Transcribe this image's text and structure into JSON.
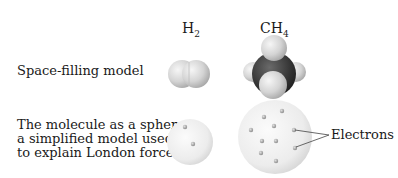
{
  "columns": [
    {
      "formula": "H",
      "subscript": "2"
    },
    {
      "formula": "CH",
      "subscript": "4"
    }
  ],
  "rows": [
    {
      "label": "Space-filling model"
    },
    {
      "label_lines": [
        "The molecule as a sphere,",
        "a simplified model used",
        "to explain London forces"
      ]
    }
  ],
  "annotation": {
    "label": "Electrons"
  },
  "colors": {
    "hydrogen": "#d8d8d8",
    "carbon": "#3a3a3a",
    "sphere": "#eeeeee",
    "electron": "#a8a8a8"
  }
}
